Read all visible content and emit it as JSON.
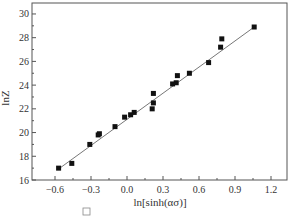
{
  "chart_data": {
    "type": "scatter",
    "title": "",
    "xlabel": "ln[sinh(ασ)]",
    "ylabel": "lnZ",
    "xlim": [
      -0.8,
      1.3
    ],
    "ylim": [
      16,
      31
    ],
    "xticks": [
      -0.6,
      -0.3,
      0.0,
      0.3,
      0.6,
      0.9,
      1.2
    ],
    "xtick_labels": [
      "−0.6",
      "−0.3",
      "0.0",
      "0.3",
      "0.6",
      "0.9",
      "1.2"
    ],
    "yticks": [
      16,
      18,
      20,
      22,
      24,
      26,
      28,
      30
    ],
    "ytick_labels": [
      "16",
      "18",
      "20",
      "22",
      "24",
      "26",
      "28",
      "30"
    ],
    "grid": false,
    "legend": null,
    "series": [
      {
        "name": "data",
        "marker": "square",
        "color": "#111111",
        "x": [
          -0.57,
          -0.46,
          -0.31,
          -0.24,
          -0.23,
          -0.1,
          -0.02,
          0.03,
          0.06,
          0.21,
          0.22,
          0.22,
          0.38,
          0.41,
          0.42,
          0.52,
          0.68,
          0.78,
          0.79,
          1.06
        ],
        "y": [
          17.0,
          17.4,
          19.0,
          19.8,
          19.9,
          20.5,
          21.3,
          21.5,
          21.7,
          22.0,
          22.5,
          23.3,
          24.1,
          24.2,
          24.8,
          25.0,
          25.9,
          27.2,
          27.9,
          28.9
        ]
      },
      {
        "name": "linear fit",
        "type": "line",
        "color": "#777777",
        "x": [
          -0.56,
          1.06
        ],
        "y": [
          17.0,
          28.9
        ]
      }
    ]
  }
}
